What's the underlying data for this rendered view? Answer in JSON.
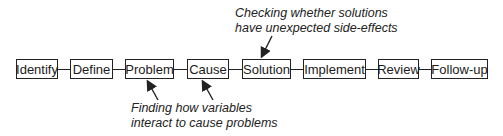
{
  "diagram": {
    "steps": [
      {
        "label": "Identify",
        "x": 16,
        "w": 42
      },
      {
        "label": "Define",
        "x": 70,
        "w": 43
      },
      {
        "label": "Problem",
        "x": 125,
        "w": 49
      },
      {
        "label": "Cause",
        "x": 187,
        "w": 42
      },
      {
        "label": "Solution",
        "x": 242,
        "w": 49
      },
      {
        "label": "Implement",
        "x": 303,
        "w": 63
      },
      {
        "label": "Review",
        "x": 378,
        "w": 41
      },
      {
        "label": "Follow-up",
        "x": 431,
        "w": 57
      }
    ],
    "annotations": {
      "top": {
        "line1": "Checking whether solutions",
        "line2": "have unexpected side-effects",
        "points_to": "Solution"
      },
      "bottom": {
        "line1": "Finding how variables",
        "line2": "interact to cause problems",
        "points_to": [
          "Problem",
          "Cause"
        ]
      }
    }
  }
}
